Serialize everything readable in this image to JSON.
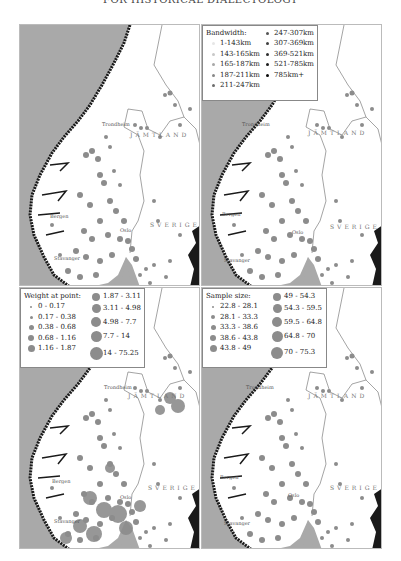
{
  "header": {
    "text": "FOR HISTORICAL DIALECTOLOGY"
  },
  "map_labels": {
    "trondheim": "Trondheim",
    "bergen": "Bergen",
    "stavanger": "Stavanger",
    "oslo": "Oslo",
    "jamtland": "JÄMTLAND",
    "sverige": "SVERIGE"
  },
  "colors": {
    "sea": "#a9a9a9",
    "land": "#ffffff",
    "coast": "#1a1a1a",
    "dot_grey": "#8c8c8c"
  },
  "panels": [
    {
      "id": "top-left",
      "legend": null
    },
    {
      "id": "top-right",
      "legend": {
        "title": "Bandwidth:",
        "col1": [
          {
            "label": "1-143km",
            "color": "#e6e6e6"
          },
          {
            "label": "143-165km",
            "color": "#c8c8c8"
          },
          {
            "label": "165-187km",
            "color": "#a8a8a8"
          },
          {
            "label": "187-211km",
            "color": "#888888"
          },
          {
            "label": "211-247km",
            "color": "#6c6c6c"
          }
        ],
        "col2": [
          {
            "label": "247-307km",
            "color": "#555555"
          },
          {
            "label": "307-369km",
            "color": "#404040"
          },
          {
            "label": "369-521km",
            "color": "#2e2e2e"
          },
          {
            "label": "521-785km",
            "color": "#1c1c1c"
          },
          {
            "label": "785km+",
            "color": "#0a0a0a"
          }
        ]
      }
    },
    {
      "id": "bottom-left",
      "legend": {
        "title": "Weight at point:",
        "col1": [
          {
            "label": "0 - 0.17",
            "size": 2
          },
          {
            "label": "0.17 - 0.38",
            "size": 3
          },
          {
            "label": "0.38 - 0.68",
            "size": 5
          },
          {
            "label": "0.68 - 1.16",
            "size": 6
          },
          {
            "label": "1.16 - 1.87",
            "size": 7
          }
        ],
        "col2": [
          {
            "label": "1.87 - 3.11",
            "size": 8
          },
          {
            "label": "3.11 - 4.98",
            "size": 9
          },
          {
            "label": "4.98 - 7.7",
            "size": 10
          },
          {
            "label": "7.7 - 14",
            "size": 11
          },
          {
            "label": "14 - 75.25",
            "size": 13
          }
        ]
      }
    },
    {
      "id": "bottom-right",
      "legend": {
        "title": "Sample size:",
        "col1": [
          {
            "label": "22.8 - 28.1",
            "size": 2
          },
          {
            "label": "28.1 - 33.3",
            "size": 4
          },
          {
            "label": "33.3 - 38.6",
            "size": 5
          },
          {
            "label": "38.6 - 43.8",
            "size": 6
          },
          {
            "label": "43.8 - 49",
            "size": 7
          }
        ],
        "col2": [
          {
            "label": "49 - 54.3",
            "size": 8
          },
          {
            "label": "54.3 - 59.5",
            "size": 9
          },
          {
            "label": "59.5 - 64.8",
            "size": 10
          },
          {
            "label": "64.8 - 70",
            "size": 11
          },
          {
            "label": "70 - 75.3",
            "size": 12
          }
        ]
      }
    }
  ]
}
